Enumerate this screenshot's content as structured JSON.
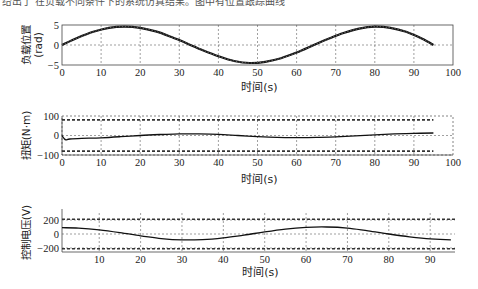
{
  "page": {
    "cutoff_caption": "给出了 在负载不同条件下的系统仿真结果。图中有位置跟踪曲线"
  },
  "chart_data": [
    {
      "type": "line",
      "title": "",
      "xlabel": "时间(s)",
      "ylabel": "负载位置",
      "ylabel_unit": "(rad)",
      "xlim": [
        0,
        100
      ],
      "ylim": [
        -5,
        5
      ],
      "xticks": [
        0,
        10,
        20,
        30,
        40,
        50,
        60,
        70,
        80,
        90,
        100
      ],
      "yticks": [
        -5,
        0,
        5
      ],
      "grid": true,
      "series": [
        {
          "name": "负载位置",
          "style": "thick dotted-black",
          "x": [
            0,
            4,
            8,
            12,
            16,
            20,
            24,
            28,
            32,
            36,
            40,
            44,
            48,
            52,
            56,
            60,
            64,
            68,
            72,
            76,
            80,
            84,
            88,
            92,
            95
          ],
          "values": [
            0.0,
            1.8,
            3.3,
            4.3,
            4.6,
            4.3,
            3.4,
            2.0,
            0.4,
            -1.3,
            -2.8,
            -4.0,
            -4.5,
            -4.2,
            -3.3,
            -1.9,
            -0.2,
            1.5,
            3.0,
            4.1,
            4.6,
            4.3,
            3.3,
            1.6,
            0.0
          ]
        }
      ]
    },
    {
      "type": "line",
      "title": "",
      "xlabel": "时间(s)",
      "ylabel": "扭矩(N·m)",
      "xlim": [
        0,
        100
      ],
      "ylim": [
        -100,
        100
      ],
      "xticks": [
        0,
        10,
        20,
        30,
        40,
        50,
        60,
        70,
        80,
        90,
        100
      ],
      "yticks": [
        -100,
        0,
        100
      ],
      "grid": true,
      "series": [
        {
          "name": "扭矩",
          "x": [
            0,
            0.5,
            1,
            2,
            5,
            10,
            15,
            20,
            25,
            30,
            35,
            40,
            45,
            50,
            55,
            60,
            65,
            70,
            75,
            80,
            85,
            90,
            95
          ],
          "values": [
            0,
            -15,
            -22,
            -18,
            -15,
            -12,
            -6,
            0,
            5,
            8,
            8,
            6,
            0,
            -6,
            -10,
            -11,
            -10,
            -7,
            -2,
            3,
            8,
            11,
            13
          ]
        },
        {
          "name": "上限",
          "style": "dashed",
          "x": [
            0,
            95
          ],
          "values": [
            80,
            80
          ]
        },
        {
          "name": "下限",
          "style": "dashed",
          "x": [
            0,
            95
          ],
          "values": [
            -80,
            -80
          ]
        }
      ]
    },
    {
      "type": "line",
      "title": "",
      "xlabel": "时间(s)",
      "ylabel": "控制电压(V)",
      "xlim": [
        1,
        96
      ],
      "ylim": [
        -220,
        320
      ],
      "xticks": [
        10,
        20,
        30,
        40,
        50,
        60,
        70,
        80,
        90
      ],
      "yticks": [
        -200,
        0,
        200
      ],
      "grid": true,
      "series": [
        {
          "name": "控制电压",
          "x": [
            1,
            5,
            10,
            15,
            20,
            25,
            30,
            35,
            40,
            45,
            50,
            55,
            60,
            65,
            70,
            75,
            80,
            85,
            90,
            95
          ],
          "values": [
            90,
            85,
            60,
            20,
            -25,
            -65,
            -85,
            -80,
            -55,
            -15,
            30,
            70,
            95,
            100,
            85,
            45,
            0,
            -40,
            -70,
            -85
          ]
        },
        {
          "name": "上限",
          "style": "dashed",
          "x": [
            1,
            96
          ],
          "values": [
            210,
            210
          ]
        },
        {
          "name": "下限",
          "style": "dashed",
          "x": [
            1,
            96
          ],
          "values": [
            -210,
            -210
          ]
        }
      ]
    }
  ]
}
